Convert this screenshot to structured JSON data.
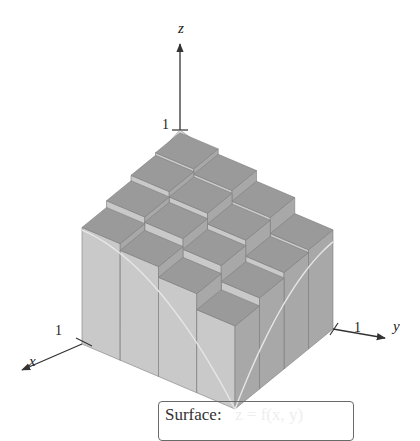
{
  "figure": {
    "axes": {
      "z_label": "z",
      "x_label": "x",
      "y_label": "y",
      "z_tick": "1",
      "x_tick": "1",
      "y_tick": "1"
    },
    "grid": {
      "n": 4,
      "heights": [
        [
          0.98,
          0.94,
          0.86,
          0.74
        ],
        [
          0.96,
          0.92,
          0.84,
          0.72
        ],
        [
          0.92,
          0.88,
          0.8,
          0.68
        ],
        [
          0.87,
          0.82,
          0.74,
          0.62
        ]
      ]
    },
    "colors": {
      "top": "#9a9a9a",
      "left": "#c9c9c9",
      "right": "#a8a8a8",
      "surface": "#bdbdbd",
      "edge": "#7d7d7d",
      "axis": "#333333",
      "curve": "#e6e6e6"
    }
  },
  "caption": {
    "label": "Surface:",
    "value": "z = f(x, y)"
  }
}
